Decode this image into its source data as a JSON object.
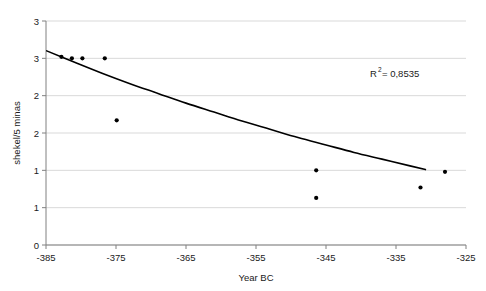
{
  "chart_data": {
    "type": "scatter",
    "title": "",
    "subtitle": "",
    "xlabel": "Year BC",
    "ylabel": "shekel/5 minas",
    "xlim": [
      -385,
      -325
    ],
    "ylim": [
      0,
      3
    ],
    "xticks": [
      -385,
      -375,
      -365,
      -355,
      -345,
      -335,
      -325
    ],
    "xticklabels": [
      "-385",
      "-375",
      "-365",
      "-355",
      "-345",
      "-335",
      "-325"
    ],
    "yticks": [
      0,
      0.5,
      1,
      1.5,
      2,
      2.5,
      3
    ],
    "yticklabels": [
      "0",
      "1",
      "1",
      "2",
      "2",
      "3",
      "3"
    ],
    "grid": "horizontal",
    "legend": "none",
    "series": [
      {
        "name": "observations",
        "type": "scatter",
        "marker": "circle",
        "color": "#000000",
        "points": [
          {
            "x": -382.8,
            "y": 2.52
          },
          {
            "x": -381.3,
            "y": 2.5
          },
          {
            "x": -379.8,
            "y": 2.5
          },
          {
            "x": -376.6,
            "y": 2.5
          },
          {
            "x": -374.9,
            "y": 1.67
          },
          {
            "x": -346.4,
            "y": 1.0
          },
          {
            "x": -346.4,
            "y": 0.63
          },
          {
            "x": -331.5,
            "y": 0.77
          },
          {
            "x": -328.0,
            "y": 0.98
          }
        ]
      },
      {
        "name": "trendline",
        "type": "line",
        "color": "#000000",
        "points": [
          {
            "x": -384.9,
            "y": 2.6
          },
          {
            "x": -381.0,
            "y": 2.45
          },
          {
            "x": -377.0,
            "y": 2.3
          },
          {
            "x": -373.0,
            "y": 2.16
          },
          {
            "x": -369.0,
            "y": 2.03
          },
          {
            "x": -365.0,
            "y": 1.9
          },
          {
            "x": -361.0,
            "y": 1.78
          },
          {
            "x": -357.0,
            "y": 1.66
          },
          {
            "x": -353.0,
            "y": 1.55
          },
          {
            "x": -349.0,
            "y": 1.44
          },
          {
            "x": -345.0,
            "y": 1.34
          },
          {
            "x": -341.0,
            "y": 1.24
          },
          {
            "x": -337.0,
            "y": 1.15
          },
          {
            "x": -333.0,
            "y": 1.06
          },
          {
            "x": -330.8,
            "y": 1.01
          }
        ]
      }
    ],
    "annotations": [
      {
        "id": "r-squared",
        "base": "R",
        "superscript": "2",
        "value": " = 0,8535",
        "full_text": "R² = 0,8535"
      }
    ],
    "colors": {
      "marker": "#000000",
      "trendline": "#000000",
      "grid": "#d9d9d9",
      "axis": "#808080",
      "text": "#1a1a1a",
      "background": "#ffffff"
    }
  }
}
